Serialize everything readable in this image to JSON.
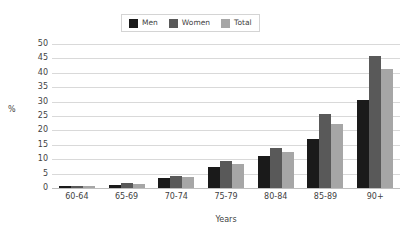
{
  "chart_data": {
    "type": "bar",
    "title": "",
    "subtitle": "",
    "xlabel": "Years",
    "ylabel": "%",
    "ylim": [
      0,
      50
    ],
    "ytick_step": 5,
    "yticks": [
      50,
      45,
      40,
      35,
      30,
      25,
      20,
      15,
      10,
      5,
      0
    ],
    "grid": true,
    "grid_axis": "y",
    "legend_position": "top-center",
    "categories": [
      "60-64",
      "65-69",
      "70-74",
      "75-79",
      "80-84",
      "85-89",
      "90+"
    ],
    "series": [
      {
        "name": "Men",
        "color": "#1a1a1a",
        "values": [
          0.6,
          1.2,
          3.4,
          7.3,
          11.1,
          17.1,
          30.7
        ]
      },
      {
        "name": "Women",
        "color": "#595959",
        "values": [
          0.7,
          1.7,
          4.1,
          9.4,
          13.8,
          25.6,
          46.0
        ]
      },
      {
        "name": "Total",
        "color": "#a6a6a6",
        "values": [
          0.6,
          1.4,
          3.7,
          8.4,
          12.6,
          22.4,
          41.4
        ]
      }
    ]
  },
  "colors": {
    "men": "#1a1a1a",
    "women": "#595959",
    "total": "#a6a6a6",
    "gridline": "#d9d9d9",
    "axis": "#bfbfbf",
    "text": "#3f3f3f",
    "legend_border": "#d4d4d4",
    "background": "#ffffff"
  }
}
